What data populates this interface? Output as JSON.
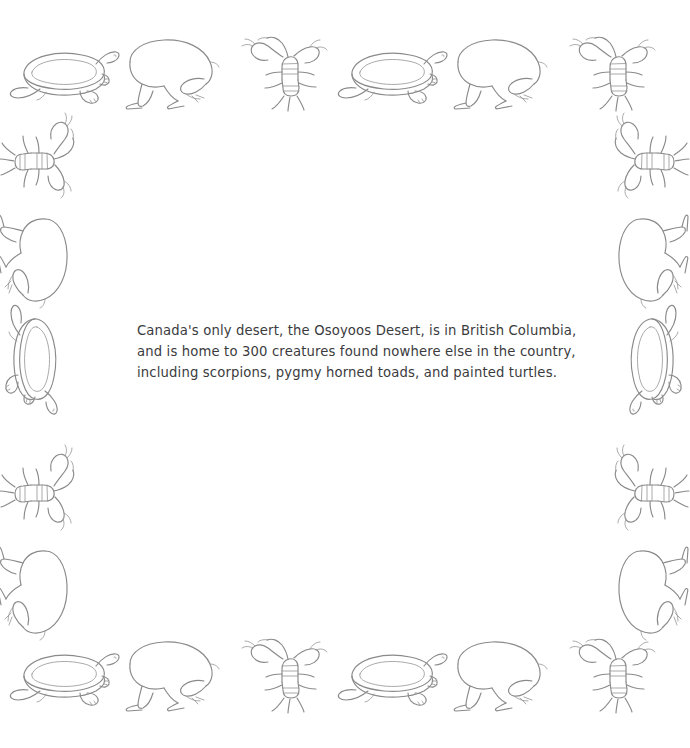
{
  "page": {
    "background_color": "#ffffff",
    "ink_color": "#8a8a8c",
    "text_color": "#3b3b3d"
  },
  "fact": {
    "full_text": "Canada's only desert, the Osoyoos Desert, is in British Columbia, and is home to 300 creatures found nowhere else in the country, including scorpions, pygmy horned toads, and painted turtles.",
    "lines": [
      "Canada's only desert, the Osoyoos Desert, is in British Columbia,",
      "and is home to 300 creatures found nowhere else in the country,",
      "including scorpions, pygmy horned toads, and painted turtles."
    ],
    "subject": "Osoyoos Desert",
    "location": "British Columbia",
    "creature_count": "300",
    "creatures_named": [
      "scorpions",
      "pygmy horned toads",
      "painted turtles"
    ]
  },
  "border": {
    "description": "Repeating hand-drawn line illustrations framing the page",
    "motifs": [
      "painted-turtle",
      "pygmy-horned-toad",
      "scorpion"
    ],
    "top_row": [
      "painted-turtle",
      "pygmy-horned-toad",
      "scorpion",
      "painted-turtle",
      "pygmy-horned-toad",
      "scorpion"
    ],
    "bottom_row": [
      "painted-turtle",
      "pygmy-horned-toad",
      "scorpion",
      "painted-turtle",
      "pygmy-horned-toad",
      "scorpion"
    ],
    "left_column": [
      "scorpion",
      "pygmy-horned-toad",
      "painted-turtle",
      "scorpion",
      "pygmy-horned-toad"
    ],
    "right_column": [
      "scorpion",
      "pygmy-horned-toad",
      "painted-turtle",
      "scorpion",
      "pygmy-horned-toad"
    ]
  }
}
